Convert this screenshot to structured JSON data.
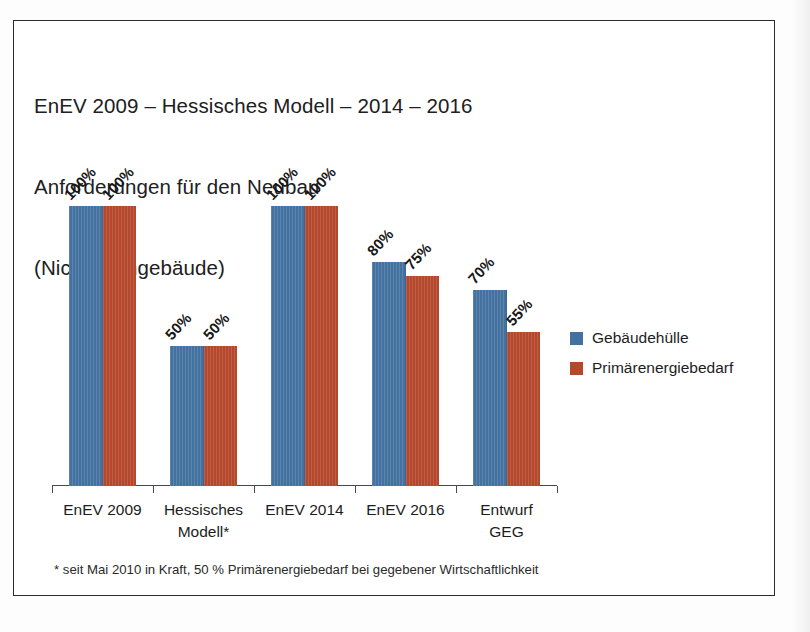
{
  "chart_data": {
    "type": "bar",
    "title": "EnEV 2009 – Hessisches Modell – 2014 – 2016",
    "title_lines": [
      "EnEV 2009 – Hessisches Modell – 2014 – 2016",
      "Anforderungen für den Neubau",
      "(Nichtwohngebäude)"
    ],
    "subtitle": "Anforderungen für den Neubau (Nichtwohngebäude)",
    "xlabel": "",
    "ylabel": "",
    "ylim": [
      0,
      100
    ],
    "grid": false,
    "legend_position": "right",
    "value_suffix": "%",
    "categories": [
      "EnEV 2009",
      "Hessisches Modell*",
      "EnEV 2014",
      "EnEV 2016",
      "Entwurf GEG"
    ],
    "category_lines": [
      [
        "EnEV 2009",
        ""
      ],
      [
        "Hessisches",
        "Modell*"
      ],
      [
        "EnEV 2014",
        ""
      ],
      [
        "EnEV 2016",
        ""
      ],
      [
        "Entwurf",
        "GEG"
      ]
    ],
    "series": [
      {
        "name": "Gebäudehülle",
        "color": "#4472a0",
        "values": [
          100,
          50,
          100,
          80,
          70
        ],
        "labels": [
          "100%",
          "50%",
          "100%",
          "80%",
          "70%"
        ]
      },
      {
        "name": "Primärenergiebedarf",
        "color": "#b4472c",
        "values": [
          100,
          50,
          100,
          75,
          55
        ],
        "labels": [
          "100%",
          "50%",
          "100%",
          "75%",
          "55%"
        ]
      }
    ],
    "footnote": "* seit Mai 2010 in Kraft, 50 % Primärenergiebedarf bei gegebener Wirtschaftlichkeit"
  },
  "legend": {
    "items": [
      {
        "label": "Gebäudehülle",
        "color": "#4472a0"
      },
      {
        "label": "Primärenergiebedarf",
        "color": "#b4472c"
      }
    ]
  },
  "colors": {
    "series_blue": "#4472a0",
    "series_red": "#b4472c",
    "frame": "#2b2b2b",
    "axis": "#4a4a4a",
    "text": "#1d1d1d",
    "background": "#ffffff"
  }
}
